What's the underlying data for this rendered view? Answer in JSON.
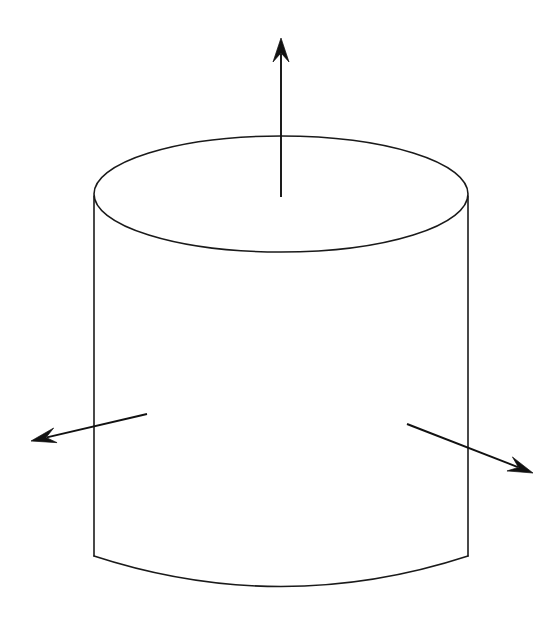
{
  "figure": {
    "title": "Cylinder with three outward normal vectors",
    "background_color": "#ffffff",
    "line_color": "#1a1a1a",
    "arrow_color": "#111111",
    "width": 556,
    "height": 644
  },
  "shape": {
    "name": "cylinder",
    "type": "right-circular-cylinder",
    "top_ellipse": {
      "center_x": 281,
      "center_y": 194,
      "radius_x": 187,
      "radius_y": 58
    },
    "bottom_arc": {
      "center_x": 281,
      "center_y": 555,
      "radius_x": 187,
      "radius_y": 62
    },
    "left_wall": {
      "x_top": 94,
      "y_top": 196,
      "x_bottom": 94,
      "y_bottom": 556
    },
    "right_wall": {
      "x_top": 468,
      "y_top": 196,
      "x_bottom": 468,
      "y_bottom": 556
    }
  },
  "arrows": [
    {
      "name": "up-arrow",
      "label": "vertical normal vector",
      "direction": "up",
      "tail_x": 281,
      "tail_y": 197,
      "tip_x": 281,
      "tip_y": 38,
      "head_width": 16,
      "head_length": 24
    },
    {
      "name": "left-arrow",
      "label": "left outward normal vector",
      "direction": "down-left",
      "tail_x": 147,
      "tail_y": 414,
      "tip_x": 31,
      "tip_y": 441,
      "head_width": 15,
      "head_length": 25
    },
    {
      "name": "right-arrow",
      "label": "right outward normal vector",
      "direction": "down-right",
      "tail_x": 407,
      "tail_y": 424,
      "tip_x": 533,
      "tip_y": 473,
      "head_width": 15,
      "head_length": 25
    }
  ],
  "chart_data": {
    "type": "diagram",
    "title": "Cylinder with three outward normal vectors",
    "elements": [
      {
        "kind": "ellipse",
        "role": "cylinder-top-face",
        "cx": 281,
        "cy": 194,
        "rx": 187,
        "ry": 58
      },
      {
        "kind": "line",
        "role": "cylinder-left-side",
        "x1": 94,
        "y1": 196,
        "x2": 94,
        "y2": 556
      },
      {
        "kind": "line",
        "role": "cylinder-right-side",
        "x1": 468,
        "y1": 196,
        "x2": 468,
        "y2": 556
      },
      {
        "kind": "arc",
        "role": "cylinder-bottom-front",
        "from_x": 94,
        "from_y": 556,
        "to_x": 468,
        "to_y": 556,
        "sag": 62
      },
      {
        "kind": "arrow",
        "role": "normal-up",
        "x1": 281,
        "y1": 197,
        "x2": 281,
        "y2": 38
      },
      {
        "kind": "arrow",
        "role": "normal-left",
        "x1": 147,
        "y1": 414,
        "x2": 31,
        "y2": 441
      },
      {
        "kind": "arrow",
        "role": "normal-right",
        "x1": 407,
        "y1": 424,
        "x2": 533,
        "y2": 473
      }
    ],
    "legend": [],
    "annotations": []
  }
}
